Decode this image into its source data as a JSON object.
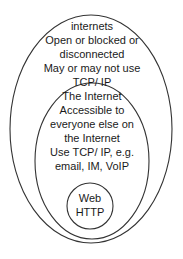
{
  "diagram": {
    "type": "nested-ellipses",
    "outer": {
      "name": "internets",
      "lines": [
        "internets",
        "Open or blocked or",
        "disconnected",
        "May or may not use",
        "TCP/ IP"
      ]
    },
    "middle": {
      "name": "the-internet",
      "lines": [
        "The Internet",
        "Accessible to",
        "everyone else on",
        "the Internet",
        "Use TCP/ IP, e.g.",
        "email, IM, VoIP"
      ]
    },
    "inner": {
      "name": "web",
      "lines": [
        "Web",
        "HTTP"
      ]
    },
    "colors": {
      "stroke": "#333333",
      "text": "#1a1a1a",
      "background": "#ffffff"
    }
  }
}
